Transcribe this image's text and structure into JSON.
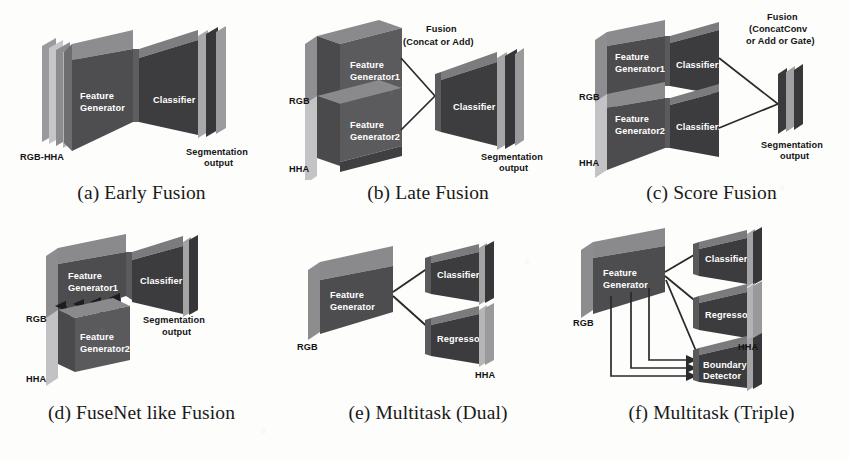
{
  "figure": {
    "background_color": "#fdfdfc",
    "block_fill_dark": "#3b3b3d",
    "block_fill_mid": "#5a5a5c",
    "block_fill_light": "#8e8e90",
    "block_fill_pale": "#b9b9bb",
    "label_color_on_block": "#ffffff",
    "label_color_outside": "#141414",
    "line_color": "#2a2a2c"
  },
  "panels": [
    {
      "id": "a",
      "caption": "(a) Early Fusion",
      "input_labels": [
        "RGB-HHA"
      ],
      "blocks": [
        {
          "name": "feature-generator",
          "label_lines": [
            "Feature",
            "Generator"
          ]
        },
        {
          "name": "classifier",
          "label_lines": [
            "Classifier"
          ]
        }
      ],
      "output_label_lines": [
        "Segmentation",
        "output"
      ],
      "fusion_label_lines": []
    },
    {
      "id": "b",
      "caption": "(b) Late Fusion",
      "input_labels": [
        "RGB",
        "HHA"
      ],
      "blocks": [
        {
          "name": "feature-generator-1",
          "label_lines": [
            "Feature",
            "Generator1"
          ]
        },
        {
          "name": "feature-generator-2",
          "label_lines": [
            "Feature",
            "Generator2"
          ]
        },
        {
          "name": "classifier",
          "label_lines": [
            "Classifier"
          ]
        }
      ],
      "output_label_lines": [
        "Segmentation",
        "output"
      ],
      "fusion_label_lines": [
        "Fusion",
        "(Concat or Add)"
      ]
    },
    {
      "id": "c",
      "caption": "(c) Score Fusion",
      "input_labels": [
        "RGB",
        "HHA"
      ],
      "blocks": [
        {
          "name": "feature-generator-1",
          "label_lines": [
            "Feature",
            "Generator1"
          ]
        },
        {
          "name": "classifier-1",
          "label_lines": [
            "Classifier1"
          ]
        },
        {
          "name": "feature-generator-2",
          "label_lines": [
            "Feature",
            "Generator2"
          ]
        },
        {
          "name": "classifier-2",
          "label_lines": [
            "Classifier2"
          ]
        }
      ],
      "output_label_lines": [
        "Segmentation",
        "output"
      ],
      "fusion_label_lines": [
        "Fusion",
        "(ConcatConv",
        "or Add or Gate)"
      ]
    },
    {
      "id": "d",
      "caption": "(d) FuseNet like Fusion",
      "input_labels": [
        "RGB",
        "HHA"
      ],
      "blocks": [
        {
          "name": "feature-generator-1",
          "label_lines": [
            "Feature",
            "Generator1"
          ]
        },
        {
          "name": "feature-generator-2",
          "label_lines": [
            "Feature",
            "Generator2"
          ]
        },
        {
          "name": "classifier",
          "label_lines": [
            "Classifier"
          ]
        }
      ],
      "output_label_lines": [
        "Segmentation",
        "output"
      ],
      "fusion_label_lines": [
        "Add"
      ],
      "fusion_arrow_count": 4
    },
    {
      "id": "e",
      "caption": "(e) Multitask (Dual)",
      "input_labels": [
        "RGB"
      ],
      "blocks": [
        {
          "name": "feature-generator",
          "label_lines": [
            "Feature",
            "Generator"
          ]
        },
        {
          "name": "classifier",
          "label_lines": [
            "Classifier"
          ]
        },
        {
          "name": "regressor",
          "label_lines": [
            "Regressor"
          ]
        }
      ],
      "output_label_lines": [
        "HHA"
      ],
      "fusion_label_lines": []
    },
    {
      "id": "f",
      "caption": "(f) Multitask (Triple)",
      "input_labels": [
        "RGB"
      ],
      "blocks": [
        {
          "name": "feature-generator",
          "label_lines": [
            "Feature",
            "Generator"
          ]
        },
        {
          "name": "classifier",
          "label_lines": [
            "Classifier"
          ]
        },
        {
          "name": "regressor",
          "label_lines": [
            "Regressor"
          ]
        },
        {
          "name": "boundary-detector",
          "label_lines": [
            "Boundary",
            "Detector"
          ]
        }
      ],
      "output_label_lines": [
        "HHA"
      ],
      "fusion_label_lines": [],
      "skip_connection_count": 3
    }
  ],
  "text": {
    "feature_generator": "Feature",
    "generator": "Generator",
    "generator1": "Generator1",
    "generator2": "Generator2",
    "classifier": "Classifier",
    "classifier1": "Classifier1",
    "classifier2": "Classifier2",
    "regressor": "Regressor",
    "boundary": "Boundary",
    "detector": "Detector",
    "rgb": "RGB",
    "hha": "HHA",
    "rgb_hha": "RGB-HHA",
    "segmentation": "Segmentation",
    "output": "output",
    "fusion": "Fusion",
    "concat_or_add": "(Concat or Add)",
    "concatconv": "(ConcatConv",
    "or_add_or_gate": "or Add or Gate)",
    "add": "Add"
  }
}
